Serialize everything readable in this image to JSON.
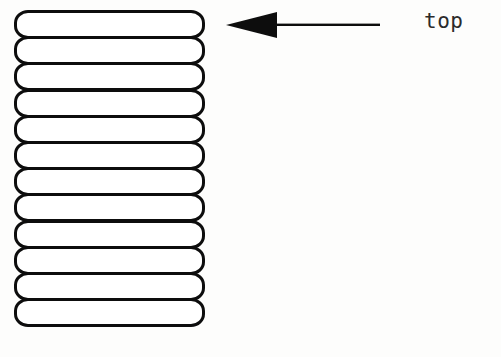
{
  "diagram": {
    "background_color": "#fdfdfc",
    "stroke_color": "#0d0d0d",
    "fill_color": "#ffffff",
    "stack": {
      "name": "layer-stack",
      "layer_count": 12,
      "left": 14,
      "top": 10,
      "width": 191,
      "height": 317,
      "layer_height": 29,
      "layer_pitch": 26.2,
      "corner_radius": 14,
      "stroke_width": 3,
      "layers": [
        {
          "index": 1
        },
        {
          "index": 2
        },
        {
          "index": 3
        },
        {
          "index": 4
        },
        {
          "index": 5
        },
        {
          "index": 6
        },
        {
          "index": 7
        },
        {
          "index": 8
        },
        {
          "index": 9
        },
        {
          "index": 10
        },
        {
          "index": 11
        },
        {
          "index": 12
        }
      ]
    },
    "annotation": {
      "arrow": {
        "name": "left-pointing-arrow",
        "direction": "left",
        "tip_x": 226,
        "tail_x": 380,
        "center_y": 25,
        "head_length": 51,
        "head_half_height": 13,
        "shaft_thickness": 2,
        "color": "#0d0d0d"
      },
      "label": {
        "name": "top-label",
        "text": "top",
        "x": 424,
        "y": 9,
        "color": "#2b2b2b"
      }
    },
    "bottom_caption": {
      "name": "clipped-caption-fragment",
      "text": "",
      "legible": false,
      "note": "cut off at image edge"
    }
  }
}
